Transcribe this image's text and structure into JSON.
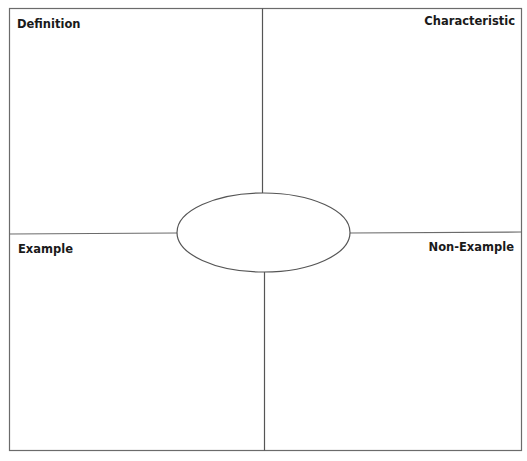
{
  "diagram": {
    "type": "frayer-model",
    "center_label": "",
    "quadrants": [
      {
        "id": "definition",
        "label": "Definition",
        "position": "top-left",
        "content": ""
      },
      {
        "id": "characteristic",
        "label": "Characteristic",
        "position": "top-right",
        "content": ""
      },
      {
        "id": "example",
        "label": "Example",
        "position": "bottom-left",
        "content": ""
      },
      {
        "id": "non-example",
        "label": "Non-Example",
        "position": "bottom-right",
        "content": ""
      }
    ],
    "colors": {
      "background": "#ffffff",
      "line": "#6b6b6b",
      "text": "#1a1a1a"
    }
  }
}
